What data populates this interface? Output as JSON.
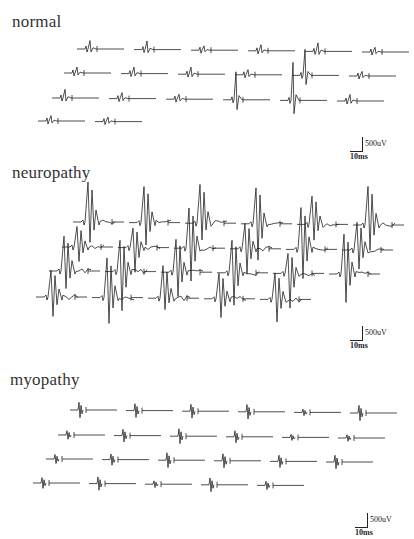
{
  "figure": {
    "panels": [
      {
        "id": "normal",
        "label": "normal",
        "scale": {
          "amplitude": "500uV",
          "time": "10ms"
        },
        "rows": [
          {
            "y": 49,
            "x0": 77,
            "count": 6,
            "spacing": 57,
            "kind": "normal"
          },
          {
            "y": 73,
            "x0": 64,
            "count": 6,
            "spacing": 57,
            "kind": "normal"
          },
          {
            "y": 98,
            "x0": 52,
            "count": 6,
            "spacing": 57,
            "kind": "normal"
          },
          {
            "y": 121,
            "x0": 38,
            "count": 2,
            "spacing": 57,
            "kind": "normal"
          }
        ],
        "big_units": [
          [
            2,
            3,
            28
          ],
          [
            2,
            4,
            38
          ],
          [
            1,
            4,
            26
          ]
        ]
      },
      {
        "id": "neuropathy",
        "label": "neuropathy",
        "scale": {
          "amplitude": "500uV",
          "time": "10ms"
        },
        "rows": [
          {
            "y": 222,
            "x0": 73,
            "count": 6,
            "spacing": 56,
            "kind": "neuro"
          },
          {
            "y": 247,
            "x0": 62,
            "count": 6,
            "spacing": 56,
            "kind": "neuro"
          },
          {
            "y": 271,
            "x0": 49,
            "count": 6,
            "spacing": 56,
            "kind": "neuro"
          },
          {
            "y": 297,
            "x0": 36,
            "count": 5,
            "spacing": 56,
            "kind": "neuro"
          }
        ]
      },
      {
        "id": "myopathy",
        "label": "myopathy",
        "scale": {
          "amplitude": "500uV",
          "time": "10ms"
        },
        "rows": [
          {
            "y": 410,
            "x0": 70,
            "count": 6,
            "spacing": 56,
            "kind": "myo"
          },
          {
            "y": 435,
            "x0": 58,
            "count": 6,
            "spacing": 56,
            "kind": "myo"
          },
          {
            "y": 459,
            "x0": 46,
            "count": 6,
            "spacing": 56,
            "kind": "myo"
          },
          {
            "y": 483,
            "x0": 33,
            "count": 5,
            "spacing": 56,
            "kind": "myo"
          }
        ]
      }
    ]
  }
}
